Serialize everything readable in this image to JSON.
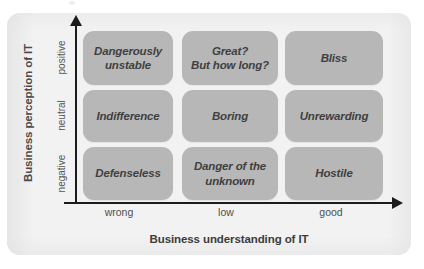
{
  "figure": {
    "title_x": "Business understanding of IT",
    "title_y": "Business perception of IT"
  },
  "chart_data": {
    "type": "table",
    "title": "",
    "xlabel": "Business understanding of IT",
    "ylabel": "Business perception of IT",
    "x_categories": [
      "wrong",
      "low",
      "good"
    ],
    "y_categories": [
      "negative",
      "neutral",
      "positive"
    ],
    "grid": false,
    "legend": "none",
    "cells": [
      {
        "x": "wrong",
        "y": "positive",
        "label": "Dangerously\nunstable"
      },
      {
        "x": "low",
        "y": "positive",
        "label": "Great?\nBut how long?"
      },
      {
        "x": "good",
        "y": "positive",
        "label": "Bliss"
      },
      {
        "x": "wrong",
        "y": "neutral",
        "label": "Indifference"
      },
      {
        "x": "low",
        "y": "neutral",
        "label": "Boring"
      },
      {
        "x": "good",
        "y": "neutral",
        "label": "Unrewarding"
      },
      {
        "x": "wrong",
        "y": "negative",
        "label": "Defenseless"
      },
      {
        "x": "low",
        "y": "negative",
        "label": "Danger of the\nunknown"
      },
      {
        "x": "good",
        "y": "negative",
        "label": "Hostile"
      }
    ],
    "colors": {
      "cell_fill": "#b7b7b7",
      "cell_text": "#3f3f3f",
      "panel_background": "#f2f2f2",
      "axis": "#1b1b1b",
      "axis_title_text": "#3c3c3c",
      "tick_text": "#4f4f4f"
    }
  },
  "matrix": {
    "rows": [
      {
        "y_tick": "positive",
        "cells": [
          {
            "text": "Dangerously\nunstable"
          },
          {
            "text": "Great?\nBut how long?"
          },
          {
            "text": "Bliss"
          }
        ]
      },
      {
        "y_tick": "neutral",
        "cells": [
          {
            "text": "Indifference"
          },
          {
            "text": "Boring"
          },
          {
            "text": "Unrewarding"
          }
        ]
      },
      {
        "y_tick": "negative",
        "cells": [
          {
            "text": "Defenseless"
          },
          {
            "text": "Danger of the\nunknown"
          },
          {
            "text": "Hostile"
          }
        ]
      }
    ],
    "x_ticks": [
      "wrong",
      "low",
      "good"
    ]
  }
}
